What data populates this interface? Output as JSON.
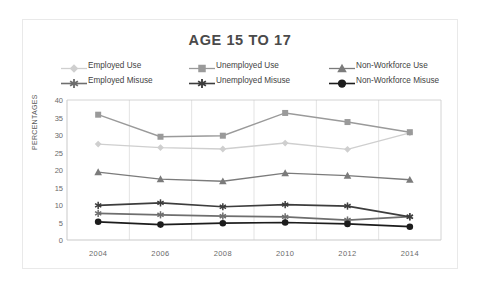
{
  "chart_data": {
    "type": "line",
    "title": "AGE 15 TO 17",
    "xlabel": "",
    "ylabel": "PERCENTAGES",
    "categories": [
      "2004",
      "2006",
      "2008",
      "2010",
      "2012",
      "2014"
    ],
    "x": [
      2004,
      2006,
      2008,
      2010,
      2012,
      2014
    ],
    "ylim": [
      0,
      40
    ],
    "yticks": [
      0,
      5,
      10,
      15,
      20,
      25,
      30,
      35,
      40
    ],
    "grid": "vertical-only",
    "legend_position": "top",
    "series": [
      {
        "name": "Employed Use",
        "values": [
          27.4,
          26.4,
          26.0,
          27.7,
          25.9,
          30.6
        ],
        "color": "#cfcfcf",
        "marker": "diamond"
      },
      {
        "name": "Unemployed Use",
        "values": [
          35.8,
          29.5,
          29.8,
          36.3,
          33.7,
          30.8
        ],
        "color": "#9a9a9a",
        "marker": "square"
      },
      {
        "name": "Non-Workforce Use",
        "values": [
          19.4,
          17.4,
          16.8,
          19.1,
          18.4,
          17.2
        ],
        "color": "#7b7b7b",
        "marker": "triangle"
      },
      {
        "name": "Employed Misuse",
        "values": [
          7.6,
          7.2,
          6.8,
          6.6,
          5.7,
          6.7
        ],
        "color": "#6e6e6e",
        "marker": "asterisk"
      },
      {
        "name": "Unemployed Misuse",
        "values": [
          9.9,
          10.6,
          9.5,
          10.1,
          9.7,
          6.6
        ],
        "color": "#3d3d3d",
        "marker": "asterisk"
      },
      {
        "name": "Non-Workforce Misuse",
        "values": [
          5.2,
          4.4,
          4.8,
          5.0,
          4.6,
          3.8
        ],
        "color": "#1c1c1c",
        "marker": "circle"
      }
    ]
  },
  "legend": {
    "rows": [
      [
        "Employed Use",
        "Unemployed Use",
        "Non-Workforce Use"
      ],
      [
        "Employed Misuse",
        "Unemployed Misuse",
        "Non-Workforce Misuse"
      ]
    ]
  },
  "colors": {
    "card_border": "#e9e9e9",
    "gridline": "#e3e3e3",
    "axis": "#c9c9c9",
    "title_text": "#4a4a4a",
    "tick_text": "#6a6a6a"
  }
}
